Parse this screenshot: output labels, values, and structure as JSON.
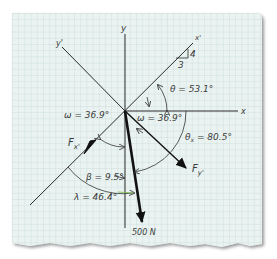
{
  "diagram": {
    "type": "free-body force diagram on graph paper",
    "paper": {
      "background": "#eaf3f1",
      "grid_color": "#c3d7d4",
      "edge_shadow": "#7a7a7a"
    },
    "axes": {
      "x": "x",
      "y": "y",
      "x_prime": "x'",
      "y_prime": "y'"
    },
    "slope_triangle": {
      "rise": "4",
      "run": "3"
    },
    "forces": {
      "applied": "500 N",
      "fx_prime": "Fx'",
      "fy_prime": "Fy'"
    },
    "angles": {
      "theta": "θ = 53.1°",
      "omega_left": "ω = 36.9°",
      "omega_right": "ω = 36.9°",
      "theta_x": "θx = 80.5°",
      "beta": "β = 9.5°",
      "lambda": "λ = 46.4°"
    },
    "colors": {
      "ink": "#2b2b2b",
      "force": "#111111",
      "lambda_arrow": "#7fbf5a"
    }
  }
}
